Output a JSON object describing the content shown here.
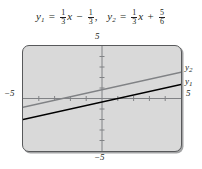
{
  "caption": {
    "eq1": {
      "lhs_var": "y",
      "lhs_sub": "1",
      "equals": "=",
      "slope_num": "1",
      "slope_den": "3",
      "x_var": "x",
      "sign": "−",
      "const_num": "1",
      "const_den": "3",
      "separator": ","
    },
    "eq2": {
      "lhs_var": "y",
      "lhs_sub": "2",
      "equals": "=",
      "slope_num": "1",
      "slope_den": "3",
      "x_var": "x",
      "sign": "+",
      "const_num": "5",
      "const_den": "6"
    }
  },
  "graph": {
    "label_top": "5",
    "label_bottom": "−5",
    "label_left": "−5",
    "label_right": "5",
    "curve_label_y1_var": "y",
    "curve_label_y1_sub": "1",
    "curve_label_y2_var": "y",
    "curve_label_y2_sub": "2",
    "window_bg": "#d9d9d9",
    "frame_color": "#58595b",
    "axis_color": "#808285",
    "y1_color": "#000000",
    "y2_color": "#808285"
  },
  "chart_data": {
    "type": "line",
    "title": "",
    "xlabel": "",
    "ylabel": "",
    "xlim": [
      -5,
      5
    ],
    "ylim": [
      -5,
      5
    ],
    "xticks": [
      -4,
      -3,
      -2,
      -1,
      1,
      2,
      3,
      4
    ],
    "yticks": [
      -4,
      -3,
      -2,
      -1,
      1,
      2,
      3,
      4
    ],
    "xtick_labels": [
      "-5",
      "5"
    ],
    "ytick_labels": [
      "-5",
      "5"
    ],
    "grid": false,
    "legend": "right-inline",
    "series": [
      {
        "name": "y₁",
        "equation": "y = (1/3)x - 1/3",
        "slope": 0.3333,
        "intercept": -0.3333,
        "color": "#000000",
        "x": [
          -5,
          5
        ],
        "values": [
          -2.0,
          1.3333
        ]
      },
      {
        "name": "y₂",
        "equation": "y = (1/3)x + 5/6",
        "slope": 0.3333,
        "intercept": 0.8333,
        "color": "#808285",
        "x": [
          -5,
          5
        ],
        "values": [
          -0.8333,
          2.5
        ]
      }
    ]
  }
}
